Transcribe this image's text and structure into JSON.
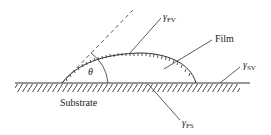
{
  "diagram": {
    "labels": {
      "gamma_fv": "γ",
      "gamma_fv_sub": "FV",
      "film": "Film",
      "gamma_sv": "γ",
      "gamma_sv_sub": "SV",
      "substrate": "Substrate",
      "gamma_fs": "γ",
      "gamma_fs_sub": "FS",
      "theta": "θ"
    },
    "colors": {
      "line": "#333333",
      "background": "#ffffff"
    }
  }
}
